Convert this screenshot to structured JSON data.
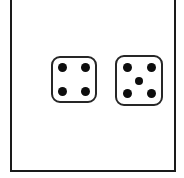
{
  "canvas": {
    "width": 184,
    "height": 178,
    "background_color": "#ffffff"
  },
  "frame": {
    "name": "picture-frame",
    "border_color": "#1a1a1a",
    "border_width": 2,
    "fill_color": "#ffffff",
    "top_edge_cropped": true
  },
  "dice": [
    {
      "id": "left",
      "face_value": 4,
      "pip_positions": [
        "top-left",
        "top-right",
        "bottom-left",
        "bottom-right"
      ],
      "face_color": "#ffffff",
      "edge_color": "#262626",
      "pip_color": "#0d0d0d"
    },
    {
      "id": "right",
      "face_value": 5,
      "pip_positions": [
        "top-left",
        "top-right",
        "center",
        "bottom-left",
        "bottom-right"
      ],
      "face_color": "#ffffff",
      "edge_color": "#262626",
      "pip_color": "#0d0d0d"
    }
  ],
  "totals": {
    "sum": 9,
    "dice_count": 2
  }
}
